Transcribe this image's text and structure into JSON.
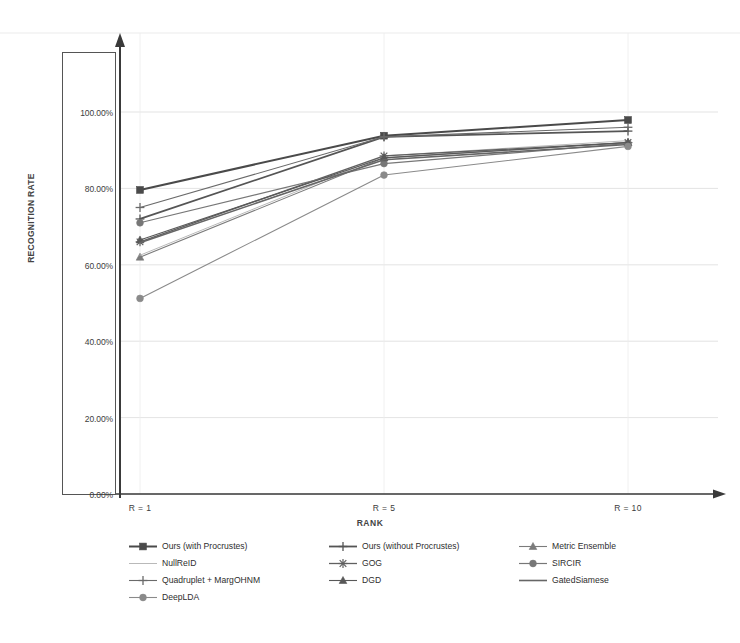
{
  "chart_data": {
    "type": "line",
    "title": "",
    "xlabel": "RANK",
    "ylabel": "RECOGNITION RATE",
    "x": [
      1,
      5,
      10
    ],
    "categories": [
      "R = 1",
      "R = 5",
      "R = 10"
    ],
    "ylim": [
      0,
      110
    ],
    "ytick_values": [
      0,
      20,
      40,
      60,
      80,
      100
    ],
    "ytick_labels": [
      "0.00%",
      "20.00%",
      "40.00%",
      "60.00%",
      "80.00%",
      "100.00%"
    ],
    "grid": true,
    "legend_position": "bottom",
    "series": [
      {
        "name": "Ours (with Procrustes)",
        "marker": "square",
        "color": "#4a4a4a",
        "width": 2.0,
        "values": [
          79.6,
          93.8,
          97.9
        ]
      },
      {
        "name": "Ours (without Procrustes)",
        "marker": "plus",
        "color": "#555555",
        "width": 1.8,
        "values": [
          72.0,
          93.5,
          95.0
        ]
      },
      {
        "name": "Metric Ensemble",
        "marker": "triangle",
        "color": "#7b7b7b",
        "width": 1.1,
        "values": [
          62.0,
          88.0,
          92.0
        ]
      },
      {
        "name": "NullReID",
        "marker": "none",
        "color": "#b9b9b9",
        "width": 1.0,
        "values": [
          62.5,
          88.5,
          92.5
        ]
      },
      {
        "name": "GOG",
        "marker": "star",
        "color": "#606060",
        "width": 1.3,
        "values": [
          66.0,
          88.5,
          92.0
        ]
      },
      {
        "name": "SIRCIR",
        "marker": "circle",
        "color": "#777777",
        "width": 1.2,
        "values": [
          71.0,
          86.5,
          91.8
        ]
      },
      {
        "name": "Quadruplet + MargOHNM",
        "marker": "plus",
        "color": "#6a6a6a",
        "width": 1.1,
        "values": [
          75.0,
          93.5,
          96.0
        ]
      },
      {
        "name": "DGD",
        "marker": "triangle",
        "color": "#585858",
        "width": 1.1,
        "values": [
          66.5,
          88.0,
          92.0
        ]
      },
      {
        "name": "GatedSiamese",
        "marker": "none",
        "color": "#666666",
        "width": 1.6,
        "values": [
          65.8,
          87.5,
          91.5
        ]
      },
      {
        "name": "DeepLDA",
        "marker": "circle",
        "color": "#8a8a8a",
        "width": 1.1,
        "values": [
          51.2,
          83.5,
          91.0
        ]
      }
    ]
  },
  "axes": {
    "y_title": "RECOGNITION RATE",
    "x_title": "RANK"
  },
  "colors": {
    "axis": "#3a3a3a",
    "grid": "#dcdcdc",
    "background": "#ffffff"
  }
}
